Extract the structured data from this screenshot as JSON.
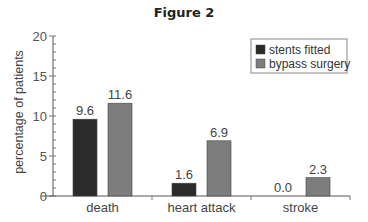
{
  "title": "Figure 2",
  "chart_data": {
    "type": "bar",
    "title": "Figure 2",
    "xlabel": "",
    "ylabel": "percentage of patients",
    "ylim": [
      0,
      20
    ],
    "yticks": [
      0,
      5,
      10,
      15,
      20
    ],
    "grid": false,
    "legend_position": "top-right",
    "categories": [
      "death",
      "heart attack",
      "stroke"
    ],
    "series": [
      {
        "name": "stents fitted",
        "color": "#2b2b2b",
        "values": [
          9.6,
          1.6,
          0.0
        ],
        "labels": [
          "9.6",
          "1.6",
          "0.0"
        ]
      },
      {
        "name": "bypass surgery",
        "color": "#7d7d7d",
        "values": [
          11.6,
          6.9,
          2.3
        ],
        "labels": [
          "11.6",
          "6.9",
          "2.3"
        ]
      }
    ]
  }
}
